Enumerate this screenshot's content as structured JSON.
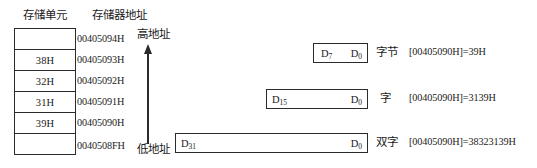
{
  "headers": {
    "memory_cell": "存储单元",
    "memory_address": "存储器地址"
  },
  "memory_table": {
    "rows": [
      {
        "value": ""
      },
      {
        "value": "38H"
      },
      {
        "value": "32H"
      },
      {
        "value": "31H"
      },
      {
        "value": "39H"
      },
      {
        "value": ""
      }
    ]
  },
  "addresses": [
    "00405094H",
    "00405093H",
    "00405092H",
    "00405091H",
    "00405090H",
    "0040508FH"
  ],
  "arrow": {
    "high_label": "高地址",
    "low_label": "低地址",
    "direction": "up"
  },
  "data_widths": [
    {
      "name": "byte",
      "msb": "D",
      "msb_index": "7",
      "lsb": "D",
      "lsb_index": "0",
      "unit_label": "字节",
      "value_note": "[00405090H]=39H"
    },
    {
      "name": "word",
      "msb": "D",
      "msb_index": "15",
      "lsb": "D",
      "lsb_index": "0",
      "unit_label": "字",
      "value_note": "[00405090H]=3139H"
    },
    {
      "name": "double-word",
      "msb": "D",
      "msb_index": "31",
      "lsb": "D",
      "lsb_index": "0",
      "unit_label": "双字",
      "value_note": "[00405090H]=38323139H"
    }
  ],
  "colors": {
    "ink": "#1a1a1a",
    "line": "#2b2b2b",
    "background": "#ffffff"
  }
}
